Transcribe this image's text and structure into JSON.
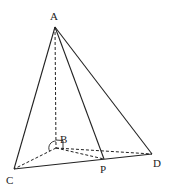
{
  "diagram": {
    "type": "geometry-tetrahedron",
    "points": {
      "A": {
        "label": "A",
        "x": 55,
        "y": 27
      },
      "B": {
        "label": "B",
        "x": 56,
        "y": 148
      },
      "C": {
        "label": "C",
        "x": 14,
        "y": 169
      },
      "P": {
        "label": "P",
        "x": 104,
        "y": 159
      },
      "D": {
        "label": "D",
        "x": 152,
        "y": 154
      }
    },
    "solid_edges": [
      "AC",
      "AP",
      "AD",
      "CD"
    ],
    "dashed_edges": [
      "AB",
      "BC",
      "BP",
      "BD"
    ],
    "right_angles": [
      "ABD",
      "ABC"
    ]
  }
}
